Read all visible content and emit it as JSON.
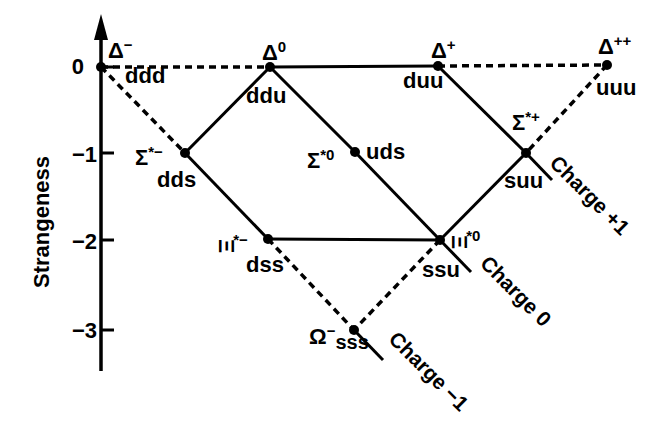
{
  "figure": {
    "y_axis": {
      "label": "Strangeness",
      "ticks": [
        "0",
        "−1",
        "−2",
        "−3"
      ]
    },
    "particles": {
      "delta_minus": {
        "symbol": "Δ",
        "sup": "−",
        "quarks": "ddd",
        "strangeness": 0
      },
      "delta_zero": {
        "symbol": "Δ",
        "sup": "0",
        "quarks": "ddu",
        "strangeness": 0
      },
      "delta_plus": {
        "symbol": "Δ",
        "sup": "+",
        "quarks": "duu",
        "strangeness": 0
      },
      "delta_plus_plus": {
        "symbol": "Δ",
        "sup": "++",
        "quarks": "uuu",
        "strangeness": 0
      },
      "sigma_minus": {
        "symbol": "Σ",
        "sup": "*−",
        "quarks": "dds",
        "strangeness": -1
      },
      "sigma_zero": {
        "symbol": "Σ",
        "sup": "*0",
        "quarks": "uds",
        "strangeness": -1
      },
      "sigma_plus": {
        "symbol": "Σ",
        "sup": "*+",
        "quarks": "suu",
        "strangeness": -1
      },
      "xi_minus": {
        "symbol": "Ξ",
        "sup": "*−",
        "quarks": "dss",
        "strangeness": -2
      },
      "xi_zero": {
        "symbol": "Ξ",
        "sup": "*0",
        "quarks": "ssu",
        "strangeness": -2
      },
      "omega_minus": {
        "symbol": "Ω",
        "sup": "−",
        "quarks": "sss",
        "strangeness": -3
      }
    },
    "charge_lines": {
      "plus1": "Charge +1",
      "zero": "Charge 0",
      "minus1": "Charge −1"
    },
    "colors": {
      "ink": "#000000",
      "background": "#ffffff"
    }
  }
}
